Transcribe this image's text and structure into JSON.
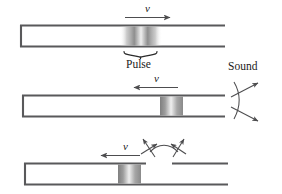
{
  "figure": {
    "background_color": "#ffffff",
    "tube_wall_color": "#59595b",
    "pulse_color_dark": "#8c8c8c",
    "pulse_color_light": "#f2f2f2",
    "arrow_color": "#4d4d4f"
  },
  "labels": {
    "v_top": "v",
    "v_middle": "v",
    "v_bottom": "v",
    "pulse": "Pulse",
    "sound": "Sound"
  },
  "panels": [
    {
      "id": "panel-top",
      "tube_end_left": "closed",
      "tube_end_right": "open",
      "pulse_position": "middle-of-tube",
      "pulse_edges": "diffuse",
      "velocity_direction": "right",
      "velocity_label": "v",
      "annotation": "Pulse",
      "sound_emitted": false
    },
    {
      "id": "panel-middle",
      "tube_end_left": "closed",
      "tube_end_right": "open",
      "pulse_position": "at-open-end",
      "pulse_edges": "sharp",
      "velocity_direction": "left",
      "velocity_label": "v",
      "annotation": "Sound",
      "sound_emitted": true,
      "sound_arcs": 2
    },
    {
      "id": "panel-bottom",
      "tube_end_left": "closed",
      "tube_end_right": "open",
      "tube_top_wall_gap": true,
      "pulse_position": "returning-left",
      "pulse_edges": "sharp",
      "velocity_direction": "left",
      "velocity_label": "v",
      "sound_emitted": true,
      "sound_arrows": 2
    }
  ],
  "icons": {
    "arrow_right": "arrow-right-icon",
    "arrow_left": "arrow-left-icon",
    "brace": "curly-brace-icon",
    "sound_arc": "sound-arc-icon",
    "radiation_arrow": "double-headed-arrow-icon"
  }
}
